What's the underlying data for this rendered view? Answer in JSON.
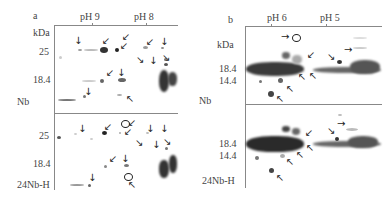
{
  "figure": {
    "panels": [
      {
        "id": "a",
        "panel_label": "a",
        "ph_labels": [
          "pH 9",
          "pH 8"
        ],
        "unit_label": "kDa",
        "top_gel": {
          "name": "Nb",
          "mw_markers": [
            "25",
            "18.4"
          ]
        },
        "bottom_gel": {
          "name": "24Nb-H",
          "mw_markers": [
            "25",
            "18.4"
          ]
        }
      },
      {
        "id": "b",
        "panel_label": "b",
        "ph_labels": [
          "pH 6",
          "pH 5"
        ],
        "unit_label": "kDa",
        "top_gel": {
          "name": "Nb",
          "mw_markers": [
            "18.4",
            "14.4"
          ]
        },
        "bottom_gel": {
          "name": "24Nb-H",
          "mw_markers": [
            "18.4",
            "14.4"
          ]
        }
      }
    ],
    "glyphs": {
      "down": "↓",
      "down_left": "↙",
      "down_right": "↘",
      "up_left": "↖",
      "right": "→"
    }
  }
}
